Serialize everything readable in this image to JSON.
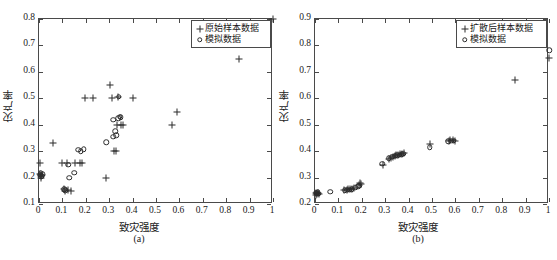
{
  "figure": {
    "caption": ""
  },
  "chart_data": [
    {
      "type": "scatter",
      "panel": "a",
      "panel_label": "(a)",
      "title": "",
      "xlabel": "致灾强度",
      "ylabel": "灾产率",
      "xlim": [
        0,
        1
      ],
      "ylim": [
        0.1,
        0.8
      ],
      "xticks": [
        "0",
        "0.1",
        "0.2",
        "0.3",
        "0.4",
        "0.5",
        "0.6",
        "0.7",
        "0.8",
        "0.9",
        "1"
      ],
      "yticks": [
        "0.1",
        "0.2",
        "0.3",
        "0.4",
        "0.5",
        "0.6",
        "0.7",
        "0.8"
      ],
      "xtick_values": [
        0,
        0.1,
        0.2,
        0.3,
        0.4,
        0.5,
        0.6,
        0.7,
        0.8,
        0.9,
        1
      ],
      "ytick_values": [
        0.1,
        0.2,
        0.3,
        0.4,
        0.5,
        0.6,
        0.7,
        0.8
      ],
      "grid": false,
      "legend_position": "upper-right",
      "series": [
        {
          "name": "原始样本数据",
          "marker": "plus",
          "points": [
            [
              0.005,
              0.255
            ],
            [
              0.005,
              0.215
            ],
            [
              0.008,
              0.205
            ],
            [
              0.01,
              0.2
            ],
            [
              0.012,
              0.21
            ],
            [
              0.06,
              0.33
            ],
            [
              0.1,
              0.255
            ],
            [
              0.105,
              0.155
            ],
            [
              0.11,
              0.15
            ],
            [
              0.118,
              0.255
            ],
            [
              0.122,
              0.153
            ],
            [
              0.135,
              0.15
            ],
            [
              0.155,
              0.255
            ],
            [
              0.175,
              0.255
            ],
            [
              0.185,
              0.255
            ],
            [
              0.195,
              0.5
            ],
            [
              0.23,
              0.5
            ],
            [
              0.285,
              0.2
            ],
            [
              0.305,
              0.55
            ],
            [
              0.31,
              0.5
            ],
            [
              0.32,
              0.3
            ],
            [
              0.33,
              0.3
            ],
            [
              0.335,
              0.4
            ],
            [
              0.338,
              0.505
            ],
            [
              0.35,
              0.4
            ],
            [
              0.36,
              0.4
            ],
            [
              0.4,
              0.5
            ],
            [
              0.57,
              0.4
            ],
            [
              0.59,
              0.45
            ],
            [
              0.855,
              0.648
            ],
            [
              1.0,
              0.8
            ]
          ]
        },
        {
          "name": "模拟数据",
          "marker": "circle",
          "points": [
            [
              0.005,
              0.21
            ],
            [
              0.008,
              0.218
            ],
            [
              0.012,
              0.205
            ],
            [
              0.015,
              0.212
            ],
            [
              0.108,
              0.155
            ],
            [
              0.112,
              0.152
            ],
            [
              0.125,
              0.248
            ],
            [
              0.13,
              0.2
            ],
            [
              0.15,
              0.218
            ],
            [
              0.168,
              0.305
            ],
            [
              0.178,
              0.3
            ],
            [
              0.192,
              0.308
            ],
            [
              0.288,
              0.333
            ],
            [
              0.318,
              0.355
            ],
            [
              0.325,
              0.375
            ],
            [
              0.33,
              0.36
            ],
            [
              0.338,
              0.425
            ],
            [
              0.34,
              0.505
            ],
            [
              0.345,
              0.43
            ],
            [
              0.35,
              0.428
            ],
            [
              0.318,
              0.418
            ]
          ]
        }
      ]
    },
    {
      "type": "scatter",
      "panel": "b",
      "panel_label": "(b)",
      "title": "",
      "xlabel": "致灾强度",
      "ylabel": "灾产率",
      "xlim": [
        0,
        1
      ],
      "ylim": [
        0.2,
        0.9
      ],
      "xticks": [
        "0",
        "0.1",
        "0.2",
        "0.3",
        "0.4",
        "0.5",
        "0.6",
        "0.7",
        "0.8",
        "0.9",
        "1"
      ],
      "yticks": [
        "0.2",
        "0.3",
        "0.4",
        "0.5",
        "0.6",
        "0.7",
        "0.8",
        "0.9"
      ],
      "xtick_values": [
        0,
        0.1,
        0.2,
        0.3,
        0.4,
        0.5,
        0.6,
        0.7,
        0.8,
        0.9,
        1
      ],
      "ytick_values": [
        0.2,
        0.3,
        0.4,
        0.5,
        0.6,
        0.7,
        0.8,
        0.9
      ],
      "grid": false,
      "legend_position": "upper-right",
      "series": [
        {
          "name": "扩散后样本数据",
          "marker": "plus",
          "points": [
            [
              0.004,
              0.24
            ],
            [
              0.006,
              0.235
            ],
            [
              0.01,
              0.238
            ],
            [
              0.014,
              0.242
            ],
            [
              0.018,
              0.237
            ],
            [
              0.125,
              0.252
            ],
            [
              0.135,
              0.253
            ],
            [
              0.142,
              0.255
            ],
            [
              0.15,
              0.256
            ],
            [
              0.158,
              0.258
            ],
            [
              0.168,
              0.262
            ],
            [
              0.186,
              0.272
            ],
            [
              0.192,
              0.278
            ],
            [
              0.196,
              0.275
            ],
            [
              0.29,
              0.348
            ],
            [
              0.318,
              0.372
            ],
            [
              0.325,
              0.375
            ],
            [
              0.332,
              0.378
            ],
            [
              0.34,
              0.382
            ],
            [
              0.348,
              0.385
            ],
            [
              0.356,
              0.386
            ],
            [
              0.364,
              0.388
            ],
            [
              0.372,
              0.39
            ],
            [
              0.38,
              0.392
            ],
            [
              0.492,
              0.428
            ],
            [
              0.572,
              0.44
            ],
            [
              0.578,
              0.442
            ],
            [
              0.59,
              0.441
            ],
            [
              0.598,
              0.44
            ],
            [
              0.855,
              0.67
            ],
            [
              1.0,
              0.752
            ]
          ]
        },
        {
          "name": "模拟数据",
          "marker": "circle",
          "points": [
            [
              0.004,
              0.243
            ],
            [
              0.008,
              0.24
            ],
            [
              0.012,
              0.245
            ],
            [
              0.016,
              0.238
            ],
            [
              0.065,
              0.246
            ],
            [
              0.128,
              0.252
            ],
            [
              0.138,
              0.254
            ],
            [
              0.148,
              0.254
            ],
            [
              0.156,
              0.256
            ],
            [
              0.172,
              0.262
            ],
            [
              0.184,
              0.268
            ],
            [
              0.19,
              0.27
            ],
            [
              0.288,
              0.352
            ],
            [
              0.316,
              0.374
            ],
            [
              0.33,
              0.378
            ],
            [
              0.344,
              0.382
            ],
            [
              0.352,
              0.384
            ],
            [
              0.362,
              0.386
            ],
            [
              0.37,
              0.389
            ],
            [
              0.378,
              0.39
            ],
            [
              0.49,
              0.415
            ],
            [
              0.57,
              0.438
            ],
            [
              0.582,
              0.44
            ],
            [
              0.594,
              0.44
            ],
            [
              1.0,
              0.782
            ]
          ]
        }
      ]
    }
  ]
}
